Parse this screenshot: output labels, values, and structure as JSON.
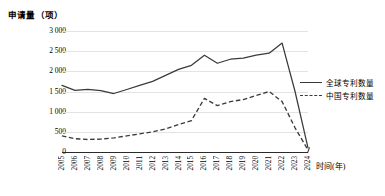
{
  "chart_data": {
    "type": "line",
    "title": "",
    "ylabel": "申请量（项）",
    "xlabel": "时间(年)",
    "ylim": [
      0,
      3000
    ],
    "ytick_labels": [
      "3 000",
      "2 500",
      "2 000",
      "1 500",
      "1 000",
      "500",
      "0"
    ],
    "ytick_values": [
      3000,
      2500,
      2000,
      1500,
      1000,
      500,
      0
    ],
    "grid": true,
    "legend_position": "right",
    "categories": [
      "2005",
      "2006",
      "2007",
      "2008",
      "2009",
      "2010",
      "2011",
      "2012",
      "2013",
      "2014",
      "2015",
      "2016",
      "2017",
      "2018",
      "2019",
      "2020",
      "2021",
      "2022",
      "2023",
      "2024"
    ],
    "series": [
      {
        "name": "全球专利数量",
        "style": "solid",
        "color": "#3a3a3a",
        "values": [
          1650,
          1530,
          1550,
          1520,
          1450,
          1550,
          1650,
          1750,
          1900,
          2050,
          2150,
          2400,
          2200,
          2300,
          2330,
          2400,
          2450,
          2700,
          1500,
          100
        ]
      },
      {
        "name": "中国专利数量",
        "style": "dashed",
        "color": "#3a3a3a",
        "values": [
          400,
          330,
          310,
          320,
          350,
          400,
          450,
          500,
          570,
          680,
          780,
          1330,
          1150,
          1250,
          1300,
          1400,
          1500,
          1250,
          600,
          50
        ]
      }
    ]
  },
  "legend": {
    "items": [
      {
        "label": "全球专利数量",
        "style": "solid"
      },
      {
        "label": "中国专利数量",
        "style": "dashed"
      }
    ]
  },
  "colors": {
    "line": "#3a3a3a",
    "grid": "#e3e3e3",
    "axis": "#2b2b2b",
    "text": "#000000",
    "background": "#ffffff"
  }
}
